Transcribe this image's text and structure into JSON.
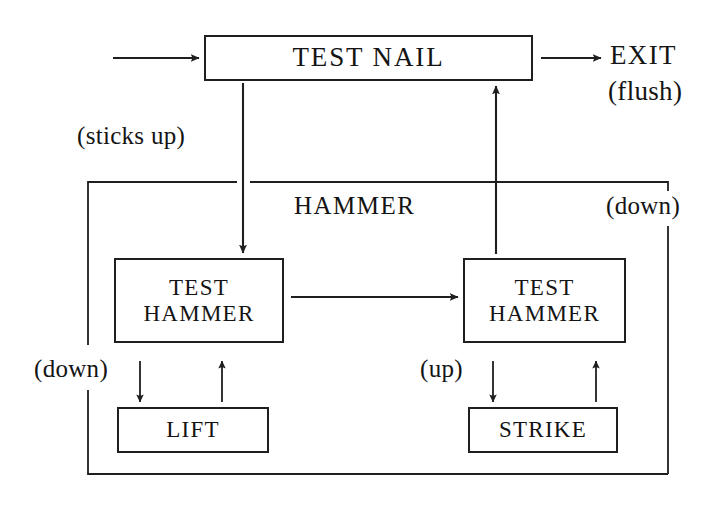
{
  "diagram": {
    "type": "flowchart",
    "canvas": {
      "width": 724,
      "height": 510
    },
    "stroke_color": "#1f1f1f",
    "background_color": "#ffffff",
    "nodes": [
      {
        "id": "test-nail",
        "lines": [
          "TEST NAIL"
        ],
        "shape": "rectangle"
      },
      {
        "id": "test-hammer-left",
        "lines": [
          "TEST",
          "HAMMER"
        ],
        "shape": "rectangle"
      },
      {
        "id": "test-hammer-right",
        "lines": [
          "TEST",
          "HAMMER"
        ],
        "shape": "rectangle"
      },
      {
        "id": "lift",
        "lines": [
          "LIFT"
        ],
        "shape": "rectangle"
      },
      {
        "id": "strike",
        "lines": [
          "STRIKE"
        ],
        "shape": "rectangle"
      }
    ],
    "labels": {
      "exit": "EXIT",
      "exit_condition": "(flush)",
      "sticks_up": "(sticks up)",
      "hammer": "HAMMER",
      "down_right": "(down)",
      "down_left": "(down)",
      "up": "(up)"
    },
    "node_text": {
      "test_nail": "TEST NAIL",
      "test_line": "TEST",
      "hammer_line": "HAMMER",
      "lift": "LIFT",
      "strike": "STRIKE"
    },
    "edges": [
      {
        "id": "entry-to-test-nail",
        "from": "entry",
        "to": "test-nail",
        "arrow": true,
        "label": ""
      },
      {
        "id": "test-nail-to-exit",
        "from": "test-nail",
        "to": "exit",
        "arrow": true,
        "label": "(flush)"
      },
      {
        "id": "test-nail-to-test-hammer-left",
        "from": "test-nail",
        "to": "test-hammer-left",
        "arrow": true,
        "label": "(sticks up)"
      },
      {
        "id": "test-hammer-left-to-test-hammer-right",
        "from": "test-hammer-left",
        "to": "test-hammer-right",
        "arrow": true,
        "label": ""
      },
      {
        "id": "test-hammer-right-to-test-nail",
        "from": "test-hammer-right",
        "to": "test-nail",
        "arrow": true,
        "label": ""
      },
      {
        "id": "test-hammer-left-to-lift",
        "from": "test-hammer-left",
        "to": "lift",
        "arrow": true,
        "label": "(down)"
      },
      {
        "id": "lift-to-test-hammer-left",
        "from": "lift",
        "to": "test-hammer-left",
        "arrow": true,
        "label": ""
      },
      {
        "id": "test-hammer-right-to-strike",
        "from": "test-hammer-right",
        "to": "strike",
        "arrow": true,
        "label": "(up)"
      },
      {
        "id": "strike-to-test-hammer-right",
        "from": "strike",
        "to": "test-hammer-right",
        "arrow": true,
        "label": ""
      },
      {
        "id": "left-loop-return",
        "from": "lift-branch",
        "to": "bottom-rail",
        "arrow": false,
        "label": ""
      },
      {
        "id": "bottom-rail-to-right",
        "from": "bottom-rail",
        "to": "right-rail",
        "arrow": false,
        "label": "(down)"
      }
    ]
  }
}
